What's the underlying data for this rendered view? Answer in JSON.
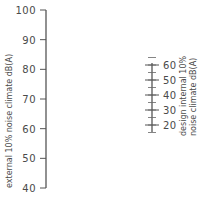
{
  "chart_data": {
    "type": "nomogram",
    "title": "",
    "scales": [
      {
        "name": "external",
        "label": "external 10% noise climate dB(A)",
        "ticks": [
          "100",
          "90",
          "80",
          "70",
          "60",
          "50",
          "40"
        ],
        "range": [
          40,
          100
        ]
      },
      {
        "name": "internal",
        "label_line1": "design internal 10%",
        "label_line2": "noise climate dB(A)",
        "ticks": [
          "60",
          "50",
          "40",
          "30",
          "20"
        ],
        "range": [
          20,
          60
        ],
        "minor_step": 5
      }
    ]
  }
}
